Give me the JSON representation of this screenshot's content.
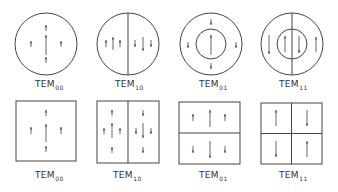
{
  "stroke_color": "#444444",
  "arrow_color": "#555555",
  "circular_modes": [
    {
      "label": "TEM",
      "subscript": "00",
      "cx": 46,
      "cy": 44,
      "r": 31,
      "inner_r": 0,
      "vertical_divider": false,
      "label_x": 35,
      "label_y": 79,
      "arrows": [
        {
          "x": 46,
          "y1": 25,
          "y2": 31,
          "dir": "up"
        },
        {
          "x": 46,
          "y1": 35,
          "y2": 55,
          "dir": "up"
        },
        {
          "x": 31,
          "y1": 41,
          "y2": 47,
          "dir": "up"
        },
        {
          "x": 61,
          "y1": 41,
          "y2": 47,
          "dir": "up"
        },
        {
          "x": 46,
          "y1": 57,
          "y2": 63,
          "dir": "up"
        }
      ]
    },
    {
      "label": "TEM",
      "subscript": "10",
      "cx": 128,
      "cy": 44,
      "r": 31,
      "inner_r": 0,
      "vertical_divider": true,
      "label_x": 115,
      "label_y": 79,
      "arrows": [
        {
          "x": 106,
          "y1": 40,
          "y2": 47,
          "dir": "up"
        },
        {
          "x": 113,
          "y1": 37,
          "y2": 50,
          "dir": "up"
        },
        {
          "x": 120,
          "y1": 40,
          "y2": 47,
          "dir": "up"
        },
        {
          "x": 135,
          "y1": 40,
          "y2": 47,
          "dir": "down"
        },
        {
          "x": 143,
          "y1": 37,
          "y2": 51,
          "dir": "down"
        },
        {
          "x": 151,
          "y1": 40,
          "y2": 47,
          "dir": "down"
        }
      ]
    },
    {
      "label": "TEM",
      "subscript": "01",
      "cx": 211,
      "cy": 44,
      "r": 31,
      "inner_r": 15,
      "vertical_divider": false,
      "label_x": 199,
      "label_y": 79,
      "arrows": [
        {
          "x": 211,
          "y1": 19,
          "y2": 25,
          "dir": "down"
        },
        {
          "x": 188,
          "y1": 42,
          "y2": 48,
          "dir": "down"
        },
        {
          "x": 236,
          "y1": 42,
          "y2": 48,
          "dir": "down"
        },
        {
          "x": 211,
          "y1": 63,
          "y2": 69,
          "dir": "down"
        },
        {
          "x": 211,
          "y1": 35,
          "y2": 55,
          "dir": "up"
        }
      ]
    },
    {
      "label": "TEM",
      "subscript": "11",
      "cx": 292,
      "cy": 44,
      "r": 31,
      "inner_r": 15,
      "vertical_divider": true,
      "label_x": 279,
      "label_y": 79,
      "arrows": [
        {
          "x": 269,
          "y1": 35,
          "y2": 54,
          "dir": "down"
        },
        {
          "x": 285,
          "y1": 36,
          "y2": 52,
          "dir": "up"
        },
        {
          "x": 299,
          "y1": 36,
          "y2": 53,
          "dir": "down"
        },
        {
          "x": 316,
          "y1": 37,
          "y2": 52,
          "dir": "up"
        }
      ]
    }
  ],
  "rectangular_modes": [
    {
      "label": "TEM",
      "subscript": "00",
      "x": 16,
      "y": 101,
      "w": 60,
      "h": 60,
      "v_divider": false,
      "h_divider": false,
      "label_x": 35,
      "label_y": 170,
      "arrows": [
        {
          "x": 46,
          "y1": 110,
          "y2": 116,
          "dir": "up"
        },
        {
          "x": 46,
          "y1": 124,
          "y2": 142,
          "dir": "up"
        },
        {
          "x": 31,
          "y1": 127,
          "y2": 134,
          "dir": "up"
        },
        {
          "x": 61,
          "y1": 127,
          "y2": 134,
          "dir": "up"
        },
        {
          "x": 46,
          "y1": 146,
          "y2": 152,
          "dir": "up"
        }
      ]
    },
    {
      "label": "TEM",
      "subscript": "10",
      "x": 97,
      "y": 101,
      "w": 62,
      "h": 62,
      "v_divider": true,
      "h_divider": false,
      "label_x": 113,
      "label_y": 170,
      "arrows": [
        {
          "x": 112,
          "y1": 110,
          "y2": 116,
          "dir": "up"
        },
        {
          "x": 104,
          "y1": 128,
          "y2": 134,
          "dir": "up"
        },
        {
          "x": 112,
          "y1": 123,
          "y2": 138,
          "dir": "up"
        },
        {
          "x": 120,
          "y1": 128,
          "y2": 134,
          "dir": "up"
        },
        {
          "x": 112,
          "y1": 147,
          "y2": 153,
          "dir": "up"
        },
        {
          "x": 143,
          "y1": 110,
          "y2": 116,
          "dir": "down"
        },
        {
          "x": 136,
          "y1": 128,
          "y2": 134,
          "dir": "down"
        },
        {
          "x": 143,
          "y1": 123,
          "y2": 138,
          "dir": "down"
        },
        {
          "x": 151,
          "y1": 128,
          "y2": 134,
          "dir": "down"
        },
        {
          "x": 143,
          "y1": 147,
          "y2": 153,
          "dir": "down"
        }
      ]
    },
    {
      "label": "TEM",
      "subscript": "01",
      "x": 179,
      "y": 102,
      "w": 61,
      "h": 62,
      "v_divider": false,
      "h_divider": true,
      "label_x": 199,
      "label_y": 170,
      "arrows": [
        {
          "x": 193,
          "y1": 114,
          "y2": 121,
          "dir": "up"
        },
        {
          "x": 210,
          "y1": 110,
          "y2": 127,
          "dir": "up"
        },
        {
          "x": 225,
          "y1": 114,
          "y2": 121,
          "dir": "up"
        },
        {
          "x": 193,
          "y1": 146,
          "y2": 153,
          "dir": "down"
        },
        {
          "x": 210,
          "y1": 141,
          "y2": 158,
          "dir": "down"
        },
        {
          "x": 225,
          "y1": 146,
          "y2": 153,
          "dir": "down"
        }
      ]
    },
    {
      "label": "TEM",
      "subscript": "11",
      "x": 261,
      "y": 103,
      "w": 61,
      "h": 61,
      "v_divider": true,
      "h_divider": true,
      "label_x": 279,
      "label_y": 170,
      "arrows": [
        {
          "x": 276,
          "y1": 110,
          "y2": 126,
          "dir": "up"
        },
        {
          "x": 307,
          "y1": 110,
          "y2": 126,
          "dir": "down"
        },
        {
          "x": 276,
          "y1": 141,
          "y2": 157,
          "dir": "down"
        },
        {
          "x": 307,
          "y1": 141,
          "y2": 157,
          "dir": "up"
        }
      ]
    }
  ]
}
